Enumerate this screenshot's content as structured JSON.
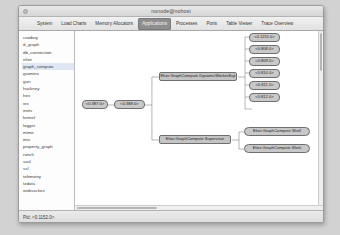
{
  "window": {
    "title": "nonode@nohost",
    "traffic_light": "window-button"
  },
  "tabs": [
    {
      "label": "System",
      "selected": false
    },
    {
      "label": "Load Charts",
      "selected": false
    },
    {
      "label": "Memory Allocators",
      "selected": false
    },
    {
      "label": "Applications",
      "selected": true
    },
    {
      "label": "Processes",
      "selected": false
    },
    {
      "label": "Ports",
      "selected": false
    },
    {
      "label": "Table Viewer",
      "selected": false
    },
    {
      "label": "Trace Overview",
      "selected": false
    }
  ],
  "sidebar": {
    "items": [
      {
        "label": "cowboy",
        "selected": false
      },
      {
        "label": "d_graph",
        "selected": false
      },
      {
        "label": "db_connection",
        "selected": false
      },
      {
        "label": "elixir",
        "selected": false
      },
      {
        "label": "graph_compute",
        "selected": true
      },
      {
        "label": "gramtex",
        "selected": false
      },
      {
        "label": "gun",
        "selected": false
      },
      {
        "label": "hackney",
        "selected": false
      },
      {
        "label": "hex",
        "selected": false
      },
      {
        "label": "iex",
        "selected": false
      },
      {
        "label": "inets",
        "selected": false
      },
      {
        "label": "kernel",
        "selected": false
      },
      {
        "label": "logger",
        "selected": false
      },
      {
        "label": "mime",
        "selected": false
      },
      {
        "label": "mix",
        "selected": false
      },
      {
        "label": "property_graph",
        "selected": false
      },
      {
        "label": "ranch",
        "selected": false
      },
      {
        "label": "sasl",
        "selected": false
      },
      {
        "label": "ssl",
        "selected": false
      },
      {
        "label": "telemetry",
        "selected": false
      },
      {
        "label": "tzdata",
        "selected": false
      },
      {
        "label": "websockex",
        "selected": false
      }
    ]
  },
  "tree": {
    "root_pid": "<0.387.0>",
    "app_sup_pid": "<0.388.0>",
    "supervisors": [
      {
        "label": "Elixir.GraphCompute.DynamicWorkerSup"
      },
      {
        "label": "Elixir.GraphCompute.Supervisor"
      }
    ],
    "workers": [
      {
        "label": "Elixir.GraphCompute.Shell"
      },
      {
        "label": "Elixir.GraphCompute.Work"
      }
    ],
    "child_pids": [
      "<0.1155.0>",
      "<0.808.0>",
      "<0.809.0>",
      "<0.810.0>",
      "<0.811.0>",
      "<0.812.0>"
    ]
  },
  "statusbar": {
    "text": "Pid: <0.1152.0>"
  },
  "colors": {
    "selected_tab_bg": "#8e8e8e",
    "node_fill": "#c8c8c8",
    "node_border": "#6f6f6f",
    "window_bg": "#ececec",
    "canvas_bg": "#ffffff"
  }
}
